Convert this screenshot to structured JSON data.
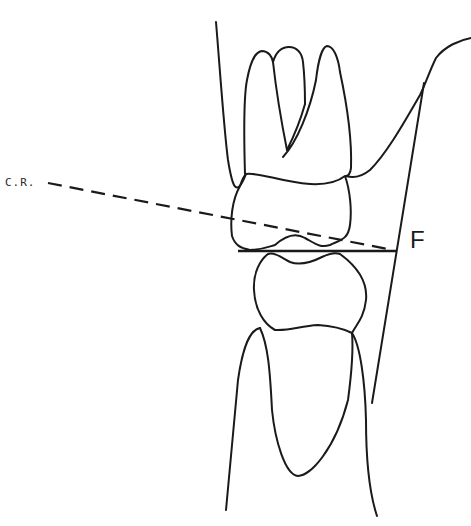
{
  "diagram": {
    "labels": {
      "centric_relation": "C.R.",
      "reference_point": "F"
    },
    "elements": [
      "upper-molar-crown",
      "upper-molar-roots",
      "lower-premolar-crown",
      "lower-premolar-root",
      "gingiva-outline",
      "centric-relation-dashed-line",
      "occlusal-plane-line",
      "reference-line-F"
    ],
    "colors": {
      "stroke": "#1a1a1a",
      "background": "#ffffff"
    }
  }
}
